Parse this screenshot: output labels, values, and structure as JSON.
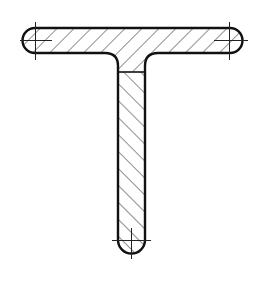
{
  "drawing": {
    "title": "T-section cross-section drawing",
    "subject": "T-profile (tee) section with hatching",
    "colors": {
      "background": "#ffffff",
      "outline": "#111111",
      "hatch": "#333333",
      "centerline": "#222222"
    },
    "parts": [
      {
        "name": "flange",
        "description": "horizontal flange with rounded ends",
        "hatch_direction": "ascending-right"
      },
      {
        "name": "web",
        "description": "vertical web with rounded bottom end",
        "hatch_direction": "descending-right"
      }
    ],
    "center_marks": [
      "left-flange-end",
      "right-flange-end",
      "web-bottom-end"
    ]
  }
}
